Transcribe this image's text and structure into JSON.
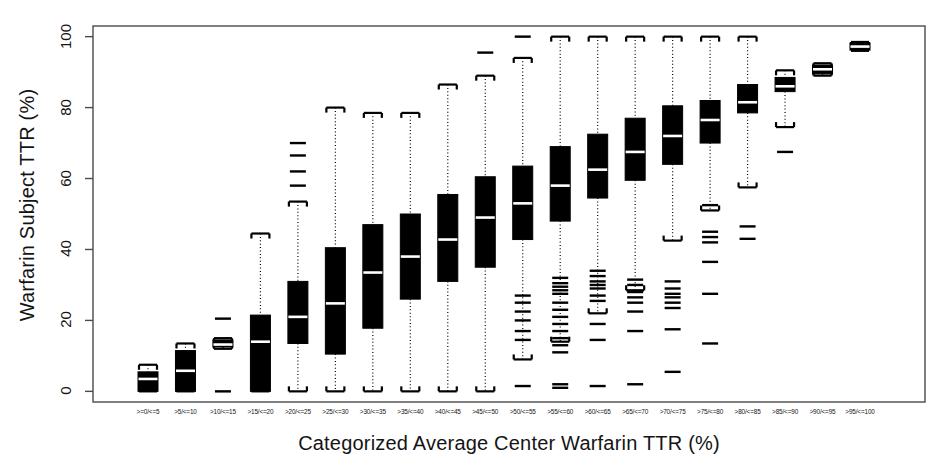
{
  "chart_data": {
    "type": "box",
    "title": "",
    "xlabel": "Categorized Average Center Warfarin TTR (%)",
    "ylabel": "Warfarin Subject TTR (%)",
    "ylim": [
      -3,
      103
    ],
    "yticks": [
      0,
      20,
      40,
      60,
      80,
      100
    ],
    "ytick_labels": [
      "0",
      "20",
      "40",
      "60",
      "80",
      "100"
    ],
    "grid": false,
    "legend": "none",
    "box_fill_color": "#000000",
    "median_color": "#ffffff",
    "whisker_style": "dotted",
    "categories": [
      ">=0/<=5",
      ">5/<=10",
      ">10/<=15",
      ">15/<=20",
      ">20/<=25",
      ">25/<=30",
      ">30/<=35",
      ">35/<=40",
      ">40/<=45",
      ">45/<=50",
      ">50/<=55",
      ">55/<=60",
      ">60/<=65",
      ">65/<=70",
      ">70/<=75",
      ">75/<=80",
      ">80/<=85",
      ">85/<=90",
      ">90/<=95",
      ">95/<=100"
    ],
    "boxes": [
      {
        "category": ">=0/<=5",
        "whisker_low": 0.0,
        "q1": 0.0,
        "median": 3.5,
        "q3": 5.5,
        "whisker_high": 7.5,
        "outliers": []
      },
      {
        "category": ">5/<=10",
        "whisker_low": 0.0,
        "q1": 0.0,
        "median": 5.8,
        "q3": 11.5,
        "whisker_high": 13.5,
        "outliers": []
      },
      {
        "category": ">10/<=15",
        "whisker_low": 12.0,
        "q1": 12.5,
        "median": 13.2,
        "q3": 14.5,
        "whisker_high": 15.0,
        "outliers": [
          0.0,
          20.5
        ]
      },
      {
        "category": ">15/<=20",
        "whisker_low": 0.0,
        "q1": 0.0,
        "median": 14.0,
        "q3": 21.5,
        "whisker_high": 44.5,
        "outliers": []
      },
      {
        "category": ">20/<=25",
        "whisker_low": 0.0,
        "q1": 13.5,
        "median": 21.0,
        "q3": 31.0,
        "whisker_high": 53.5,
        "outliers": [
          58.0,
          62.0,
          66.5,
          70.0
        ]
      },
      {
        "category": ">25/<=30",
        "whisker_low": 0.0,
        "q1": 10.5,
        "median": 24.8,
        "q3": 40.5,
        "whisker_high": 80.0,
        "outliers": []
      },
      {
        "category": ">30/<=35",
        "whisker_low": 0.0,
        "q1": 17.8,
        "median": 33.5,
        "q3": 47.0,
        "whisker_high": 78.5,
        "outliers": []
      },
      {
        "category": ">35/<=40",
        "whisker_low": 0.0,
        "q1": 26.0,
        "median": 38.0,
        "q3": 50.0,
        "whisker_high": 78.5,
        "outliers": []
      },
      {
        "category": ">40/<=45",
        "whisker_low": 0.0,
        "q1": 31.0,
        "median": 42.8,
        "q3": 55.5,
        "whisker_high": 86.5,
        "outliers": []
      },
      {
        "category": ">45/<=50",
        "whisker_low": 0.0,
        "q1": 35.0,
        "median": 49.0,
        "q3": 60.5,
        "whisker_high": 89.0,
        "outliers": [
          95.5
        ]
      },
      {
        "category": ">50/<=55",
        "whisker_low": 9.0,
        "q1": 42.8,
        "median": 53.0,
        "q3": 63.5,
        "whisker_high": 94.0,
        "outliers": [
          100.0,
          27.0,
          25.0,
          22.5,
          20.0,
          17.0,
          14.5,
          1.5
        ]
      },
      {
        "category": ">55/<=60",
        "whisker_low": 14.0,
        "q1": 48.0,
        "median": 58.0,
        "q3": 69.0,
        "whisker_high": 100.0,
        "outliers": [
          32.0,
          30.5,
          29.5,
          28.5,
          27.5,
          25.0,
          23.0,
          21.0,
          19.0,
          17.0,
          15.0,
          13.0,
          11.0,
          2.0,
          1.0
        ]
      },
      {
        "category": ">60/<=65",
        "whisker_low": 22.0,
        "q1": 54.5,
        "median": 62.5,
        "q3": 72.5,
        "whisker_high": 100.0,
        "outliers": [
          34.0,
          32.5,
          31.0,
          30.0,
          29.0,
          27.0,
          25.5,
          19.0,
          14.5,
          1.5
        ]
      },
      {
        "category": ">65/<=70",
        "whisker_low": 28.5,
        "q1": 59.5,
        "median": 67.5,
        "q3": 77.0,
        "whisker_high": 100.0,
        "outliers": [
          31.5,
          30.0,
          28.0,
          26.5,
          25.0,
          22.5,
          17.0,
          2.0
        ]
      },
      {
        "category": ">70/<=75",
        "whisker_low": 42.5,
        "q1": 64.0,
        "median": 72.0,
        "q3": 80.5,
        "whisker_high": 100.0,
        "outliers": [
          31.0,
          29.0,
          27.5,
          26.5,
          25.0,
          23.5,
          17.5,
          5.5
        ]
      },
      {
        "category": ">75/<=80",
        "whisker_low": 51.0,
        "q1": 70.0,
        "median": 76.5,
        "q3": 82.0,
        "whisker_high": 100.0,
        "outliers": [
          52.5,
          45.0,
          43.5,
          42.0,
          36.5,
          27.5,
          13.5
        ]
      },
      {
        "category": ">80/<=85",
        "whisker_low": 57.5,
        "q1": 78.5,
        "median": 81.5,
        "q3": 86.5,
        "whisker_high": 100.0,
        "outliers": [
          46.5,
          43.0
        ]
      },
      {
        "category": ">85/<=90",
        "whisker_low": 74.5,
        "q1": 84.5,
        "median": 86.0,
        "q3": 88.5,
        "whisker_high": 90.5,
        "outliers": [
          67.5
        ]
      },
      {
        "category": ">90/<=95",
        "whisker_low": 89.0,
        "q1": 89.5,
        "median": 90.8,
        "q3": 92.0,
        "whisker_high": 92.5,
        "outliers": []
      },
      {
        "category": ">95/<=100",
        "whisker_low": 96.0,
        "q1": 96.2,
        "median": 97.2,
        "q3": 98.2,
        "whisker_high": 98.5,
        "outliers": []
      }
    ]
  },
  "axes": {
    "y_title": "Warfarin Subject TTR (%)",
    "x_title": "Categorized Average Center Warfarin TTR (%)"
  }
}
